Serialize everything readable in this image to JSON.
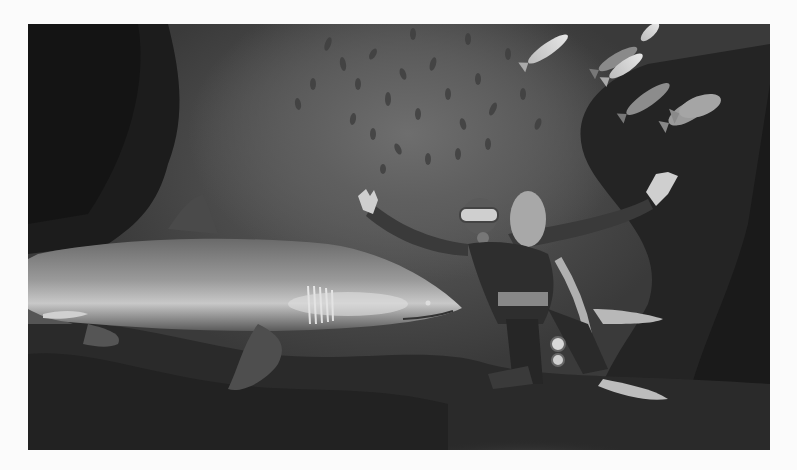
{
  "image": {
    "description": "Grayscale underwater photograph: a scuba diver with arms outstretched beside a large sand tiger shark, with a school of small fish above and larger silver fish at upper right, over a rocky reef.",
    "subjects": [
      "shark",
      "scuba-diver",
      "fish-school",
      "silver-fish",
      "rocky-reef"
    ],
    "tones": {
      "frame_background": "#fbfbfb",
      "water_light": "#6e6e6e",
      "water_mid": "#4a4a4a",
      "rock_dark": "#1e1e1e",
      "highlight": "#d8d8d8"
    }
  }
}
